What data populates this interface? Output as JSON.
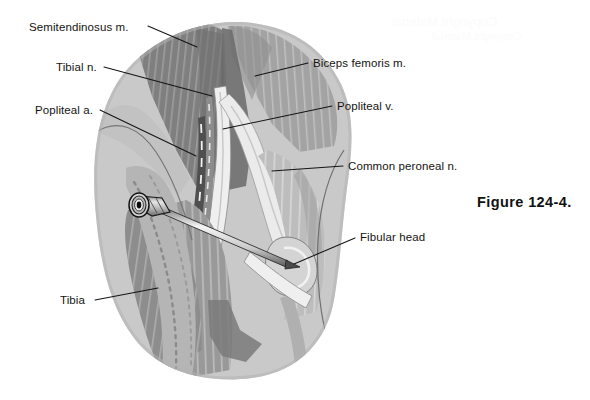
{
  "figure": {
    "caption": "Figure 124-4.",
    "alt_title": "Posterior view of the popliteal fossa with needle placement for popliteal nerve block",
    "background_color": "#ffffff",
    "line_color": "#141414",
    "text_color": "#15130f"
  },
  "watermark": {
    "text": "Copyright Material"
  },
  "labels": [
    {
      "id": "semitendinosus",
      "text": "Semitendinosus m.",
      "side": "left",
      "text_x": 29,
      "text_y": 22,
      "leader": {
        "x1": 148,
        "y1": 26,
        "x2": 197,
        "y2": 47
      }
    },
    {
      "id": "tibial-nerve",
      "text": "Tibial n.",
      "side": "left",
      "text_x": 56,
      "text_y": 62,
      "leader": {
        "x1": 104,
        "y1": 67,
        "x2": 212,
        "y2": 96
      }
    },
    {
      "id": "popliteal-artery",
      "text": "Popliteal a.",
      "side": "left",
      "text_x": 35,
      "text_y": 105,
      "leader": {
        "x1": 100,
        "y1": 110,
        "x2": 196,
        "y2": 156
      }
    },
    {
      "id": "tibia",
      "text": "Tibia",
      "side": "left",
      "text_x": 60,
      "text_y": 295,
      "leader": {
        "x1": 95,
        "y1": 300,
        "x2": 158,
        "y2": 288
      }
    },
    {
      "id": "biceps-femoris",
      "text": "Biceps femoris m.",
      "side": "right",
      "text_x": 313,
      "text_y": 58,
      "leader": {
        "x1": 308,
        "y1": 63,
        "x2": 255,
        "y2": 76
      }
    },
    {
      "id": "popliteal-vein",
      "text": "Popliteal v.",
      "side": "right",
      "text_x": 337,
      "text_y": 101,
      "leader": {
        "x1": 332,
        "y1": 106,
        "x2": 223,
        "y2": 129
      }
    },
    {
      "id": "common-peroneal",
      "text": "Common peroneal n.",
      "side": "right",
      "text_x": 348,
      "text_y": 161,
      "leader": {
        "x1": 343,
        "y1": 166,
        "x2": 272,
        "y2": 171
      }
    },
    {
      "id": "fibular-head",
      "text": "Fibular head",
      "side": "right",
      "text_x": 360,
      "text_y": 232,
      "leader": {
        "x1": 355,
        "y1": 238,
        "x2": 294,
        "y2": 264
      }
    }
  ],
  "anatomy": {
    "structures": [
      {
        "name": "skin-outline",
        "color": "#cfcfcf"
      },
      {
        "name": "semitendinosus-muscle",
        "color": "#8a8a8a"
      },
      {
        "name": "biceps-femoris-muscle",
        "color": "#a6a6a6"
      },
      {
        "name": "tibial-nerve",
        "color": "#f1f1f1"
      },
      {
        "name": "common-peroneal-nerve",
        "color": "#e8e8e8"
      },
      {
        "name": "popliteal-vein",
        "color": "#7a7a7a"
      },
      {
        "name": "popliteal-artery",
        "color": "#5c5c5c"
      },
      {
        "name": "tibia-bone",
        "color": "#b8b8b8"
      },
      {
        "name": "fibular-head-bone",
        "color": "#d2d2d2"
      },
      {
        "name": "gastrocnemius-muscle",
        "color": "#9b9b9b"
      },
      {
        "name": "needle",
        "color": "#dedede"
      },
      {
        "name": "needle-hub",
        "color": "#c4c4c4"
      }
    ]
  }
}
